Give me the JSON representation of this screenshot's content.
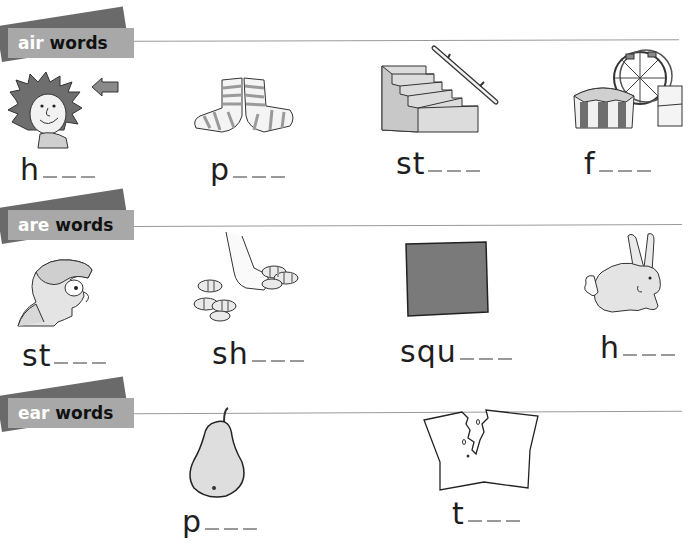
{
  "worksheet": {
    "sections": [
      {
        "id": "air",
        "banner_prefix": "air",
        "banner_suffix": "words",
        "items": [
          {
            "picture": "spiky-hair-boy",
            "word_start": "h",
            "blank_count": 3
          },
          {
            "picture": "striped-socks",
            "word_start": "p",
            "blank_count": 3
          },
          {
            "picture": "stairs-with-handrail",
            "word_start": "st",
            "blank_count": 3
          },
          {
            "picture": "fairground-big-wheel",
            "word_start": "f",
            "blank_count": 3
          }
        ]
      },
      {
        "id": "are",
        "banner_prefix": "are",
        "banner_suffix": "words",
        "items": [
          {
            "picture": "staring-boy",
            "word_start": "st",
            "blank_count": 3
          },
          {
            "picture": "sharing-sweets",
            "word_start": "sh",
            "blank_count": 3
          },
          {
            "picture": "grey-square",
            "word_start": "squ",
            "blank_count": 3
          },
          {
            "picture": "hare",
            "word_start": "h",
            "blank_count": 3
          }
        ]
      },
      {
        "id": "ear",
        "banner_prefix": "ear",
        "banner_suffix": "words",
        "items": [
          {
            "picture": "pear",
            "word_start": "p",
            "blank_count": 3
          },
          {
            "picture": "torn-paper",
            "word_start": "t",
            "blank_count": 3
          }
        ]
      }
    ],
    "colors": {
      "banner_front": "#a8a8a8",
      "banner_back": "#6a6a6a",
      "rule_line": "#9a9a9a",
      "blank_line": "#9a9a9a",
      "text": "#1e1e1e"
    }
  }
}
